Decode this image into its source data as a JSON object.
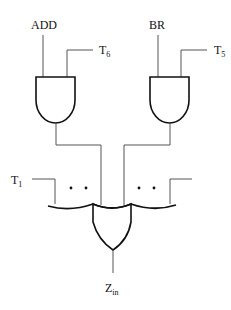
{
  "diagram": {
    "type": "logic-circuit",
    "gates": [
      {
        "id": "and1",
        "kind": "AND",
        "inputs": [
          "ADD",
          "T6"
        ]
      },
      {
        "id": "and2",
        "kind": "AND",
        "inputs": [
          "BR",
          "T5"
        ]
      },
      {
        "id": "or1",
        "kind": "OR",
        "inputs": [
          "T1",
          "...",
          "and1",
          "and2",
          "...",
          "unlabeled"
        ],
        "output": "Zin"
      }
    ],
    "labels": {
      "add": "ADD",
      "t6_main": "T",
      "t6_sub": "6",
      "br": "BR",
      "t5_main": "T",
      "t5_sub": "5",
      "t1_main": "T",
      "t1_sub": "1",
      "zin_main": "Z",
      "zin_sub": "in"
    },
    "ellipsis": "• •"
  }
}
